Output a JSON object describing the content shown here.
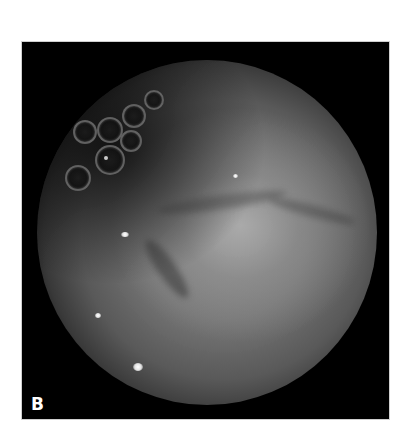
{
  "figure": {
    "panel_label": "B",
    "image_description": "Endoscopic circular field of view showing mucosal surface with air bubbles in upper-left",
    "colors": {
      "frame_background": "#000000",
      "page_background": "#ffffff",
      "label_color": "#ffffff",
      "field_center": "#a0a0a0",
      "field_edge": "#1a1a1a"
    }
  }
}
